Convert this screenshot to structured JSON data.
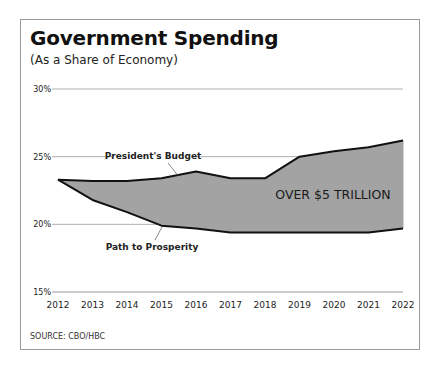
{
  "header": {
    "title": "Government Spending",
    "subtitle": "(As a Share of Economy)"
  },
  "footer": {
    "source": "SOURCE: CBO/HBC"
  },
  "chart_data": {
    "type": "area",
    "title": "Government Spending",
    "subtitle": "(As a Share of Economy)",
    "xlabel": "",
    "ylabel": "",
    "x": [
      2012,
      2013,
      2014,
      2015,
      2016,
      2017,
      2018,
      2019,
      2020,
      2021,
      2022
    ],
    "x_tick_labels": [
      "2012",
      "2013",
      "2014",
      "2015",
      "2016",
      "2017",
      "2018",
      "2019",
      "2020",
      "2021",
      "2022"
    ],
    "y_ticks": [
      15,
      20,
      25,
      30
    ],
    "y_tick_labels": [
      "15%",
      "20%",
      "25%",
      "30%"
    ],
    "ylim": [
      15,
      30
    ],
    "grid": true,
    "series": [
      {
        "name": "President's Budget",
        "values": [
          23.3,
          23.2,
          23.2,
          23.4,
          23.9,
          23.4,
          23.4,
          25.0,
          25.4,
          25.7,
          26.2
        ]
      },
      {
        "name": "Path to Prosperity",
        "values": [
          23.3,
          21.8,
          20.9,
          19.9,
          19.7,
          19.4,
          19.4,
          19.4,
          19.4,
          19.4,
          19.7
        ]
      }
    ],
    "fill_between": {
      "upper": "President's Budget",
      "lower": "Path to Prosperity",
      "color": "#a3a3a3"
    },
    "annotations": [
      {
        "text": "President's Budget",
        "target_series": "President's Budget",
        "target_x": 2016
      },
      {
        "text": "Path to Prosperity",
        "target_series": "Path to Prosperity",
        "target_x": 2015
      },
      {
        "text": "OVER $5 TRILLION",
        "x": 2020,
        "y": 23.0
      }
    ],
    "colors": {
      "fill": "#a3a3a3",
      "line": "#111111",
      "grid": "#9a9a9a"
    },
    "source": "SOURCE: CBO/HBC"
  }
}
